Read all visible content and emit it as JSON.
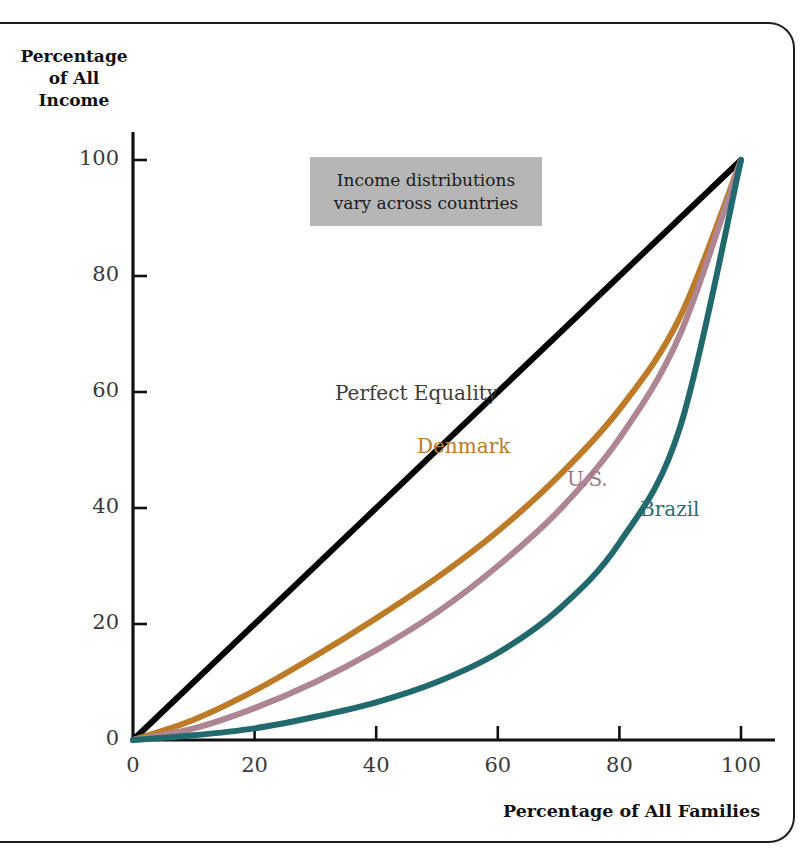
{
  "figure": {
    "background_color": "#ffffff",
    "frame_color": "#1c1c1c"
  },
  "annotation": {
    "text": "Income distributions\nvary across countries",
    "background_color": "#b6b6b6"
  },
  "axis": {
    "y_title": "Percentage\nof All\nIncome",
    "x_title": "Percentage of All Families"
  },
  "chart_data": {
    "type": "line",
    "title": "",
    "subtitle": "",
    "xlabel": "Percentage of All Families",
    "ylabel": "Percentage of All Income",
    "xlim": [
      0,
      100
    ],
    "ylim": [
      0,
      100
    ],
    "xticks": [
      "0",
      "20",
      "40",
      "60",
      "80",
      "100"
    ],
    "yticks": [
      "0",
      "20",
      "40",
      "60",
      "80",
      "100"
    ],
    "grid": false,
    "legend_position": "inline-labels",
    "annotations": [
      "Income distributions vary across countries"
    ],
    "x": [
      0,
      10,
      20,
      30,
      40,
      50,
      60,
      70,
      80,
      90,
      100
    ],
    "series": [
      {
        "name": "Perfect Equality",
        "color": "#000000",
        "width": 6,
        "values": [
          0,
          10,
          20,
          30,
          40,
          50,
          60,
          70,
          80,
          90,
          100
        ]
      },
      {
        "name": "Denmark",
        "color": "#bd7b28",
        "width": 6,
        "values": [
          0,
          3.5,
          8.5,
          14.5,
          21,
          28,
          36,
          45.5,
          57,
          73,
          100
        ]
      },
      {
        "name": "U.S.",
        "color": "#ae8593",
        "width": 6,
        "values": [
          0,
          2,
          5.5,
          10,
          15.5,
          22,
          30,
          39.5,
          52,
          70,
          100
        ]
      },
      {
        "name": "Brazil",
        "color": "#22696e",
        "width": 6,
        "values": [
          0,
          0.8,
          2,
          4,
          6.5,
          10,
          15,
          22.5,
          34,
          54,
          100
        ]
      }
    ]
  }
}
